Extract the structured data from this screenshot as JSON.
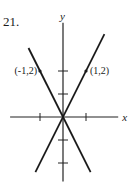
{
  "problem_number": "21.",
  "axes": {
    "x_label": "x",
    "y_label": "y",
    "x_ticks": [
      -1,
      1
    ],
    "y_ticks": [
      -2,
      -1,
      1,
      2
    ],
    "x_range": [
      -2.3,
      2.4
    ],
    "y_range": [
      -2.8,
      4.1
    ]
  },
  "lines": [
    {
      "name": "y = 2x",
      "slope": 2,
      "intercept": 0,
      "x_range": [
        -1.2,
        1.8
      ]
    },
    {
      "name": "y = -2x",
      "slope": -2,
      "intercept": 0,
      "x_range": [
        -1.5,
        1.2
      ]
    }
  ],
  "points": [
    {
      "x": -1,
      "y": 2,
      "label": "(-1,2)",
      "label_side": "left"
    },
    {
      "x": 1,
      "y": 2,
      "label": "(1,2)",
      "label_side": "right"
    }
  ]
}
